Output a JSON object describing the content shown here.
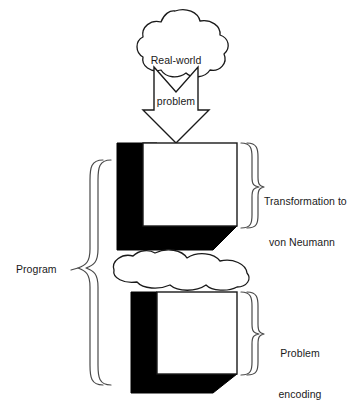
{
  "diagram": {
    "type": "flow-diagram",
    "background_color": "#ffffff",
    "stroke_color": "#1a1a1a",
    "fill_solid_color": "#000000",
    "fill_face_color": "#ffffff",
    "nodes": {
      "cloud_top": {
        "shape": "cloud",
        "line1": "Real-world",
        "line2": "problem"
      },
      "arrow_down": {
        "shape": "block-arrow-down",
        "fill": "#ffffff",
        "outline": "#1a1a1a"
      },
      "block_upper": {
        "shape": "3d-cube",
        "face_fill": "#ffffff",
        "extrusion_fill": "#000000"
      },
      "cloud_middle": {
        "shape": "cloud",
        "label": ""
      },
      "block_lower": {
        "shape": "3d-cube",
        "face_fill": "#ffffff",
        "extrusion_fill": "#000000"
      }
    },
    "annotations": {
      "program": {
        "label": "Program",
        "brace_side": "left"
      },
      "transformation": {
        "line1": "Transformation to",
        "line2": "von Neumann",
        "brace_side": "right"
      },
      "problem_encoding": {
        "line1": "Problem",
        "line2": "encoding",
        "brace_side": "right"
      }
    }
  }
}
